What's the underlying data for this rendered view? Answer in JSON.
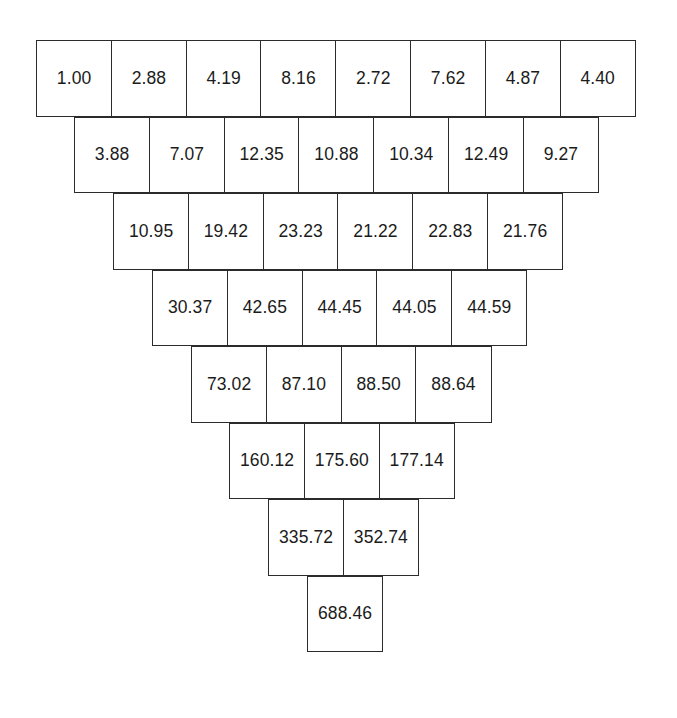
{
  "diagram": {
    "type": "inverted-triangle-grid",
    "row_count": 8,
    "cell_width_px": 76,
    "cell_height_px": 76,
    "row_offset_px": 38,
    "border_color": "#2b2b2b",
    "cell_fill_color": "#ffffff",
    "text_color": "#1b1b1b",
    "background_color": "#ffffff",
    "rows": [
      {
        "index": 0,
        "cells": [
          "1.00",
          "2.88",
          "4.19",
          "8.16",
          "2.72",
          "7.62",
          "4.87",
          "4.40"
        ]
      },
      {
        "index": 1,
        "cells": [
          "3.88",
          "7.07",
          "12.35",
          "10.88",
          "10.34",
          "12.49",
          "9.27"
        ]
      },
      {
        "index": 2,
        "cells": [
          "10.95",
          "19.42",
          "23.23",
          "21.22",
          "22.83",
          "21.76"
        ]
      },
      {
        "index": 3,
        "cells": [
          "30.37",
          "42.65",
          "44.45",
          "44.05",
          "44.59"
        ]
      },
      {
        "index": 4,
        "cells": [
          "73.02",
          "87.10",
          "88.50",
          "88.64"
        ]
      },
      {
        "index": 5,
        "cells": [
          "160.12",
          "175.60",
          "177.14"
        ]
      },
      {
        "index": 6,
        "cells": [
          "335.72",
          "352.74"
        ]
      },
      {
        "index": 7,
        "cells": [
          "688.46"
        ]
      }
    ]
  },
  "chart_data": {
    "type": "table",
    "xlabel": "",
    "ylabel": "",
    "orientation": "inverted-pyramid",
    "rows": [
      [
        1.0,
        2.88,
        4.19,
        8.16,
        2.72,
        7.62,
        4.87,
        4.4
      ],
      [
        3.88,
        7.07,
        12.35,
        10.88,
        10.34,
        12.49,
        9.27
      ],
      [
        10.95,
        19.42,
        23.23,
        21.22,
        22.83,
        21.76
      ],
      [
        30.37,
        42.65,
        44.45,
        44.05,
        44.59
      ],
      [
        73.02,
        87.1,
        88.5,
        88.64
      ],
      [
        160.12,
        175.6,
        177.14
      ],
      [
        335.72,
        352.74
      ],
      [
        688.46
      ]
    ],
    "row_lengths": [
      8,
      7,
      6,
      5,
      4,
      3,
      2,
      1
    ],
    "min_value": 1.0,
    "max_value": 688.46,
    "apex_value": 688.46
  }
}
